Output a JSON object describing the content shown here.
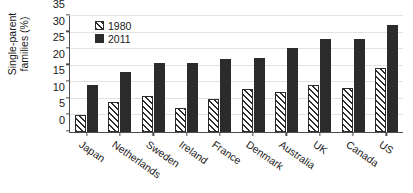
{
  "chart_data": {
    "type": "bar",
    "title": "",
    "xlabel": "",
    "ylabel": "Single-parent\nfamilies (%)",
    "ylim": [
      0,
      35
    ],
    "yticks": [
      0,
      5,
      10,
      15,
      20,
      25,
      30,
      35
    ],
    "grid": true,
    "legend_position": "top-left",
    "categories": [
      "Japan",
      "Netherlands",
      "Sweden",
      "Ireland",
      "France",
      "Denmark",
      "Australia",
      "UK",
      "Canada",
      "US"
    ],
    "series": [
      {
        "name": "1980",
        "style": "hatched",
        "color": "#2b2b2b",
        "values": [
          5.0,
          9.0,
          11.0,
          7.2,
          10.1,
          13.1,
          12.2,
          14.3,
          13.3,
          19.4
        ]
      },
      {
        "name": "2011",
        "style": "solid",
        "color": "#2b2b2b",
        "values": [
          14.1,
          18.0,
          20.8,
          20.8,
          22.0,
          22.3,
          25.2,
          28.0,
          28.0,
          32.2
        ]
      }
    ]
  },
  "axis": {
    "tick_labels": [
      "0",
      "5",
      "10",
      "15",
      "20",
      "25",
      "30",
      "35"
    ],
    "y_title": "Single-parent\nfamilies (%)"
  },
  "legend": {
    "items": [
      {
        "label": "1980",
        "swatch": "hatched-square-icon"
      },
      {
        "label": "2011",
        "swatch": "filled-square-icon"
      }
    ]
  }
}
